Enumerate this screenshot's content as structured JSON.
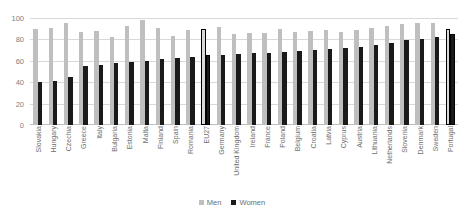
{
  "chart_data": {
    "type": "bar",
    "title": "",
    "xlabel": "",
    "ylabel": "",
    "ylim": [
      0,
      100
    ],
    "yticks": [
      0,
      20,
      40,
      60,
      80,
      100
    ],
    "grid": true,
    "legend_position": "bottom",
    "highlight_categories": [
      "EU27",
      "Portugal"
    ],
    "categories": [
      "Slovakia",
      "Hungary",
      "Czechia",
      "Greece",
      "Italy",
      "Bulgaria",
      "Estonia",
      "Malta",
      "Finland",
      "Spain",
      "Romania",
      "EU27",
      "Germany",
      "United Kingdom",
      "Ireland",
      "France",
      "Poland",
      "Belgium",
      "Croatia",
      "Latvia",
      "Cyprus",
      "Austria",
      "Lithuania",
      "Netherlands",
      "Slovenia",
      "Denmark",
      "Sweden",
      "Portugal"
    ],
    "series": [
      {
        "name": "Men",
        "color": "#bfbfbf",
        "values": [
          90,
          91,
          95,
          87,
          88,
          82,
          93,
          98,
          91,
          83,
          89,
          90,
          92,
          85,
          86,
          86,
          90,
          87,
          88,
          89,
          87,
          89,
          91,
          93,
          94,
          95,
          95,
          90
        ]
      },
      {
        "name": "Women",
        "color": "#1a1a1a",
        "values": [
          40,
          41,
          45,
          55,
          56,
          58,
          59,
          60,
          62,
          63,
          64,
          65,
          65,
          66,
          67,
          67,
          68,
          69,
          70,
          71,
          72,
          73,
          75,
          77,
          79,
          80,
          82,
          85
        ]
      }
    ]
  },
  "legend": {
    "items": [
      {
        "label": "Men"
      },
      {
        "label": "Women"
      }
    ]
  }
}
